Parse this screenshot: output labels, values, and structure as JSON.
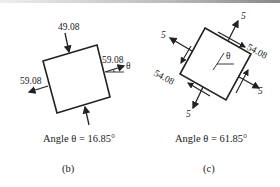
{
  "panels": [
    {
      "id": "b",
      "caption": "(b)",
      "angle_text": "Angle θ = 16.85°",
      "labels": {
        "top": "49.08",
        "right": "59.08",
        "left": "59.08",
        "theta": "θ"
      }
    },
    {
      "id": "c",
      "caption": "(c)",
      "angle_text": "Angle θ = 61.85°",
      "labels": {
        "normal_top": "5",
        "normal_left": "5",
        "normal_right": "5",
        "normal_bottom": "5",
        "shear_upper_right": "54.08",
        "shear_lower_left": "54.08",
        "theta": "θ"
      }
    }
  ]
}
